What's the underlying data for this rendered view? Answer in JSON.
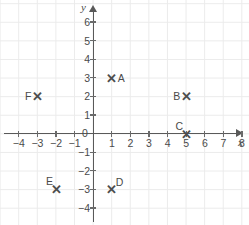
{
  "chart_data": {
    "type": "scatter",
    "title": "",
    "xlabel": "x",
    "ylabel": "y",
    "xlim": [
      -5,
      8.8
    ],
    "ylim": [
      -4.8,
      6.6
    ],
    "grid": true,
    "legend": "none",
    "x_ticks": [
      -4,
      -3,
      -2,
      -1,
      1,
      2,
      3,
      4,
      5,
      6,
      7,
      8
    ],
    "x_tick_labels": [
      "−4",
      "−3",
      "−2",
      "−1",
      "1",
      "2",
      "3",
      "4",
      "5",
      "6",
      "7",
      "8"
    ],
    "y_ticks": [
      6,
      5,
      4,
      3,
      2,
      1,
      -1,
      -2,
      -3,
      -4
    ],
    "y_tick_labels": [
      "6",
      "5",
      "4",
      "3",
      "2",
      "1",
      "−1",
      "−2",
      "−3",
      "−4"
    ],
    "origin_label": "0",
    "marker_glyph": "✕",
    "grid_color": "#ebebeb",
    "axis_color": "#595959",
    "text_color": "#4a4a4a",
    "points": [
      {
        "label": "A",
        "x": 1,
        "y": 3,
        "label_position": "right"
      },
      {
        "label": "B",
        "x": 5,
        "y": 2,
        "label_position": "left"
      },
      {
        "label": "C",
        "x": 5,
        "y": 0,
        "label_position": "upper-left"
      },
      {
        "label": "D",
        "x": 1,
        "y": -3,
        "label_position": "upper-right"
      },
      {
        "label": "E",
        "x": -2,
        "y": -3,
        "label_position": "upper-left"
      },
      {
        "label": "F",
        "x": -3,
        "y": 2,
        "label_position": "left"
      }
    ]
  }
}
